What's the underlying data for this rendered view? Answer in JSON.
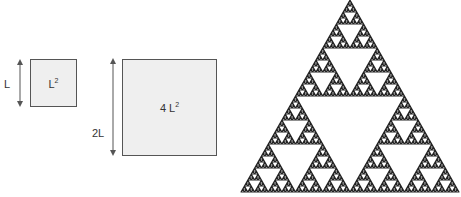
{
  "diagram": {
    "small_square": {
      "side_label": "L",
      "area_base": "L",
      "area_exp": "2"
    },
    "large_square": {
      "side_label": "2L",
      "area_base": "4 L",
      "area_exp": "2"
    },
    "fractal": {
      "name": "Sierpinski triangle",
      "depth": 6,
      "color": "#222222"
    }
  }
}
